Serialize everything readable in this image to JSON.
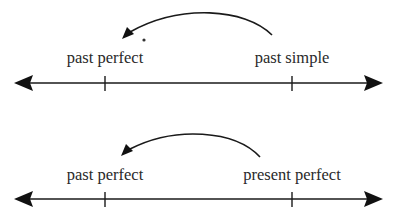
{
  "diagrams": [
    {
      "name": "past-simple-to-past-perfect",
      "left_label": "past perfect",
      "right_label": "past simple",
      "arrow_direction": "right-to-left",
      "stray_mark": "ꜞ"
    },
    {
      "name": "present-perfect-to-past-perfect",
      "left_label": "past perfect",
      "right_label": "present perfect",
      "arrow_direction": "right-to-left"
    }
  ],
  "colors": {
    "line": "#1a1a1a",
    "text": "#2a2a2a",
    "background": "#ffffff"
  }
}
